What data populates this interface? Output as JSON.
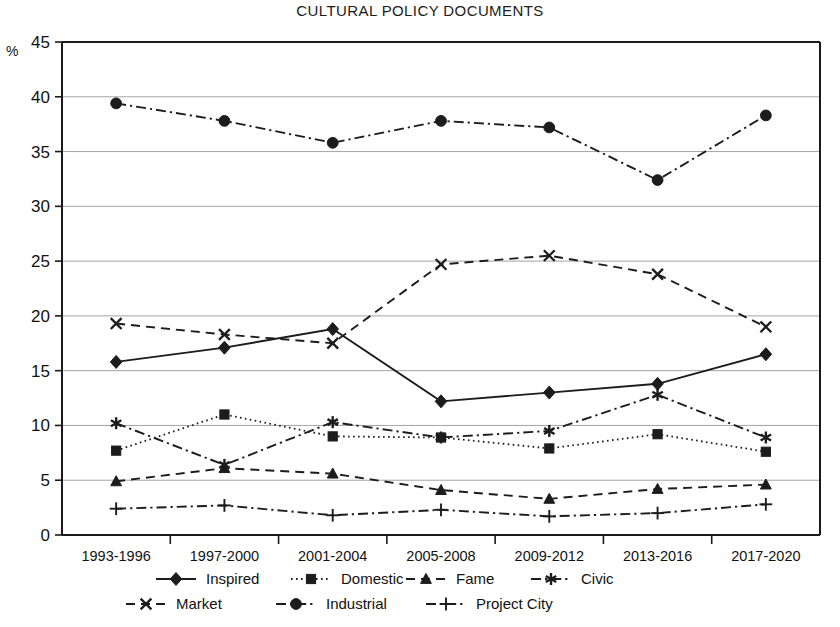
{
  "chart_data": {
    "type": "line",
    "title": "CULTURAL POLICY DOCUMENTS",
    "xlabel": "",
    "ylabel": "%",
    "ylim": [
      0,
      45
    ],
    "ytick_step": 5,
    "yticks": [
      0,
      5,
      10,
      15,
      20,
      25,
      30,
      35,
      40,
      45
    ],
    "grid": true,
    "legend_position": "bottom",
    "categories": [
      "1993-1996",
      "1997-2000",
      "2001-2004",
      "2005-2008",
      "2009-2012",
      "2013-2016",
      "2017-2020"
    ],
    "series": [
      {
        "name": "Inspired",
        "marker": "diamond",
        "dash": "solid",
        "values": [
          15.8,
          17.1,
          18.8,
          12.2,
          13.0,
          13.8,
          16.5
        ]
      },
      {
        "name": "Domestic",
        "marker": "square",
        "dash": "dotted",
        "values": [
          7.7,
          11.0,
          9.0,
          8.9,
          7.9,
          9.2,
          7.6
        ]
      },
      {
        "name": "Fame",
        "marker": "triangle",
        "dash": "dashed",
        "values": [
          4.9,
          6.1,
          5.6,
          4.1,
          3.3,
          4.2,
          4.6
        ]
      },
      {
        "name": "Civic",
        "marker": "asterisk",
        "dash": "dashdot",
        "values": [
          10.2,
          6.4,
          10.3,
          8.9,
          9.5,
          12.8,
          8.9
        ]
      },
      {
        "name": "Market",
        "marker": "cross",
        "dash": "dashed",
        "values": [
          19.3,
          18.3,
          17.5,
          24.7,
          25.5,
          23.8,
          19.0
        ]
      },
      {
        "name": "Industrial",
        "marker": "circle",
        "dash": "dashdot",
        "values": [
          39.4,
          37.8,
          35.8,
          37.8,
          37.2,
          32.4,
          38.3
        ]
      },
      {
        "name": "Project City",
        "marker": "plus",
        "dash": "dashdot",
        "values": [
          2.4,
          2.7,
          1.8,
          2.3,
          1.7,
          2.0,
          2.8
        ]
      }
    ],
    "colors": {
      "ink": "#1c1c1c",
      "grid": "#9a9a9a",
      "background": "#ffffff"
    }
  },
  "legend": {
    "row1": [
      "Inspired",
      "Domestic",
      "Fame",
      "Civic"
    ],
    "row2": [
      "Market",
      "Industrial",
      "Project City"
    ]
  }
}
